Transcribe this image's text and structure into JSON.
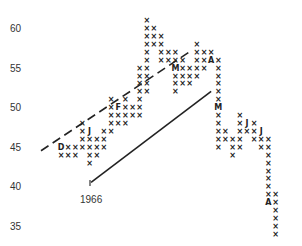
{
  "chart_data": {
    "type": "point-and-figure",
    "title": "",
    "xlabel": "",
    "ylabel": "",
    "y_ticks": [
      60,
      55,
      50,
      45,
      40,
      35
    ],
    "ylim": [
      34,
      62
    ],
    "annotations": [
      {
        "text": "1966",
        "position": "below trendline start"
      },
      {
        "text": "I",
        "position": "tick marker above 1966"
      }
    ],
    "month_markers": [
      "D",
      "J",
      "F",
      "M",
      "A",
      "M",
      "J",
      "J",
      "A"
    ],
    "trendlines": [
      {
        "style": "dashed",
        "from": [
          0,
          44.5
        ],
        "to": [
          18,
          57
        ]
      },
      {
        "style": "solid",
        "from": [
          7,
          40.5
        ],
        "to": [
          21,
          52
        ]
      }
    ],
    "columns": [
      {
        "col": 0,
        "cells": {
          "45": "D",
          "44": "X"
        }
      },
      {
        "col": 1,
        "cells": {
          "45": "X",
          "44": "X"
        }
      },
      {
        "col": 2,
        "cells": {
          "45": "X",
          "44": "X"
        }
      },
      {
        "col": 3,
        "cells": {
          "48": "X",
          "47": "X",
          "46": "X",
          "45": "X"
        }
      },
      {
        "col": 4,
        "cells": {
          "47": "J",
          "46": "X",
          "45": "X",
          "44": "X",
          "43": "X"
        }
      },
      {
        "col": 5,
        "cells": {
          "46": "X",
          "45": "X",
          "44": "X"
        }
      },
      {
        "col": 6,
        "cells": {
          "47": "X",
          "46": "X",
          "45": "X"
        }
      },
      {
        "col": 7,
        "cells": {
          "51": "X",
          "50": "X",
          "49": "X",
          "48": "X",
          "47": "X"
        }
      },
      {
        "col": 8,
        "cells": {
          "50": "F",
          "49": "X",
          "48": "X"
        }
      },
      {
        "col": 9,
        "cells": {
          "51": "X",
          "50": "X",
          "49": "X",
          "48": "X"
        }
      },
      {
        "col": 10,
        "cells": {
          "50": "X",
          "49": "X"
        }
      },
      {
        "col": 11,
        "cells": {
          "55": "X",
          "54": "X",
          "53": "X",
          "52": "X",
          "51": "X",
          "50": "X",
          "49": "X"
        }
      },
      {
        "col": 12,
        "cells": {
          "61": "X",
          "60": "X",
          "59": "X",
          "58": "X",
          "57": "X",
          "56": "X",
          "55": "X",
          "54": "X",
          "53": "X",
          "52": "X"
        }
      },
      {
        "col": 13,
        "cells": {
          "60": "X",
          "59": "X",
          "58": "X"
        }
      },
      {
        "col": 14,
        "cells": {
          "59": "X",
          "58": "X",
          "57": "X",
          "56": "X"
        }
      },
      {
        "col": 15,
        "cells": {
          "57": "X",
          "56": "X"
        }
      },
      {
        "col": 16,
        "cells": {
          "57": "X",
          "56": "X",
          "55": "M",
          "54": "X",
          "53": "X",
          "52": "X"
        }
      },
      {
        "col": 17,
        "cells": {
          "56": "X",
          "55": "X",
          "54": "X",
          "53": "X"
        }
      },
      {
        "col": 18,
        "cells": {
          "55": "X",
          "54": "X",
          "53": "X"
        }
      },
      {
        "col": 19,
        "cells": {
          "58": "X",
          "57": "X",
          "56": "X",
          "55": "X",
          "54": "X"
        }
      },
      {
        "col": 20,
        "cells": {
          "57": "X",
          "56": "X",
          "55": "X"
        }
      },
      {
        "col": 21,
        "cells": {
          "57": "X",
          "56": "A"
        }
      },
      {
        "col": 22,
        "cells": {
          "56": "X",
          "55": "X",
          "54": "X",
          "53": "X",
          "52": "X",
          "51": "X",
          "50": "M",
          "49": "X",
          "48": "X",
          "47": "X",
          "46": "X",
          "45": "X"
        }
      },
      {
        "col": 23,
        "cells": {
          "47": "X",
          "46": "X"
        }
      },
      {
        "col": 24,
        "cells": {
          "46": "X",
          "45": "X",
          "44": "X"
        }
      },
      {
        "col": 25,
        "cells": {
          "49": "X",
          "48": "X",
          "47": "X",
          "46": "X",
          "45": "X"
        }
      },
      {
        "col": 26,
        "cells": {
          "48": "J",
          "47": "X"
        }
      },
      {
        "col": 27,
        "cells": {
          "48": "X",
          "47": "X",
          "46": "X"
        }
      },
      {
        "col": 28,
        "cells": {
          "47": "J",
          "46": "X",
          "45": "X"
        }
      },
      {
        "col": 29,
        "cells": {
          "46": "X",
          "45": "X",
          "44": "X",
          "43": "X",
          "42": "X",
          "41": "X",
          "40": "X",
          "39": "X",
          "38": "A"
        }
      },
      {
        "col": 30,
        "cells": {
          "39": "X",
          "38": "X",
          "37": "X",
          "36": "X",
          "35": "X",
          "34": "X"
        }
      }
    ]
  }
}
